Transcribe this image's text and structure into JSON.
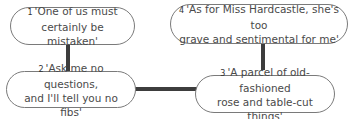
{
  "diagram": {
    "nodes": [
      {
        "id": 1,
        "number": "1",
        "line1": "'One of us must",
        "line2": "certainly be mistaken'"
      },
      {
        "id": 2,
        "number": "2",
        "line1": "'Ask me no questions,",
        "line2": "and I'll tell you no fibs'"
      },
      {
        "id": 3,
        "number": "3",
        "line1": "'A parcel of old-fashioned",
        "line2": "rose and table-cut things'"
      },
      {
        "id": 4,
        "number": "4",
        "line1": "'As for Miss Hardcastle, she's too",
        "line2": "grave and sentimental for me'"
      }
    ],
    "edges": [
      {
        "from": 1,
        "to": 2
      },
      {
        "from": 2,
        "to": 3
      },
      {
        "from": 4,
        "to": 3
      }
    ],
    "colors": {
      "connector": "#3d3d3d",
      "bubble_border": "#7a7a7a",
      "text": "#4a4a4a",
      "background": "#ffffff"
    }
  }
}
